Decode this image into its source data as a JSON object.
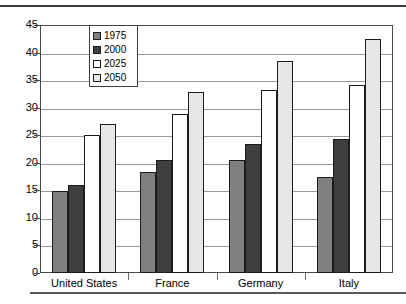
{
  "chart_data": {
    "type": "bar",
    "title": "",
    "xlabel": "",
    "ylabel": "",
    "ylim": [
      0,
      45
    ],
    "yticks": [
      0,
      5,
      10,
      15,
      20,
      25,
      30,
      35,
      40,
      45
    ],
    "grid": true,
    "legend_position": "upper-left-inside",
    "categories": [
      "United States",
      "France",
      "Germany",
      "Italy"
    ],
    "series": [
      {
        "name": "1975",
        "color": "#808080",
        "values": [
          14.8,
          18.3,
          20.5,
          17.5
        ]
      },
      {
        "name": "2000",
        "color": "#3f3f3f",
        "values": [
          16.0,
          20.5,
          23.4,
          24.3
        ]
      },
      {
        "name": "2025",
        "color": "#ffffff",
        "values": [
          25.0,
          28.8,
          33.2,
          34.2
        ]
      },
      {
        "name": "2050",
        "color": "#e6e6e6",
        "values": [
          27.0,
          32.8,
          38.4,
          42.5
        ]
      }
    ]
  },
  "axis": {
    "tick_labels": [
      "45",
      "40",
      "35",
      "30",
      "25",
      "20",
      "15",
      "10",
      "5",
      "0"
    ]
  },
  "legend": {
    "entries": [
      {
        "label": "1975"
      },
      {
        "label": "2000"
      },
      {
        "label": "2025"
      },
      {
        "label": "2050"
      }
    ]
  },
  "categories": [
    {
      "label": "United States"
    },
    {
      "label": "France"
    },
    {
      "label": "Germany"
    },
    {
      "label": "Italy"
    }
  ]
}
